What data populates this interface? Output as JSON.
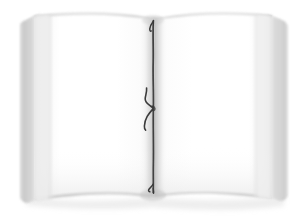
{
  "scene": {
    "title": "Open blank book",
    "background_color": "#ffffff",
    "width": 305,
    "height": 222
  },
  "book": {
    "object_name": "open-book",
    "state": "open",
    "page_count_visible": 2,
    "content_text": "",
    "bounds": {
      "left": 20,
      "top": 10,
      "right": 288,
      "bottom": 207
    },
    "colors": {
      "page_face": "#ffffff",
      "page_shade": "#f2f2f2",
      "page_edge": "#d8d8d8",
      "block_edge": "#c9c9c9",
      "block_edge_dark": "#b4b4b4",
      "gutter_shadow": "#cfcfcf",
      "cord": "#3a3a3a",
      "cord_highlight": "#5c5c5c",
      "cast_shadow": "#e6e6e6"
    }
  },
  "left_page": {
    "label": "left-page",
    "text": "",
    "is_blank": true,
    "spine_x": 152,
    "outer_x": 20
  },
  "right_page": {
    "label": "right-page",
    "text": "",
    "is_blank": true,
    "spine_x": 155,
    "outer_x": 288
  },
  "spine": {
    "label": "spine-gutter",
    "center_x": 153,
    "top_y": 18,
    "bottom_y": 196
  },
  "cord": {
    "label": "binding-cord",
    "color": "#3a3a3a",
    "top_fork_y": 20,
    "knot_y": 108,
    "tail_end_y": 130,
    "bottom_end_y": 192,
    "stroke_width": 1.6
  },
  "alt_text": "A photograph of an open book with two blank white pages and a dark binding cord tied down the center spine."
}
